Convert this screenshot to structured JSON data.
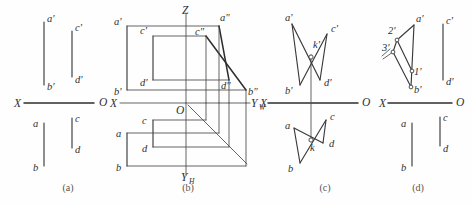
{
  "figure": {
    "background_color": "#fefefe",
    "line_color": "#3a3a3a",
    "width": 472,
    "height": 205
  },
  "panels": [
    {
      "id": "a",
      "caption": "(a)",
      "caption_x": 68,
      "caption_y": 191,
      "axis": {
        "x_label": "X",
        "o_label": "O",
        "x_label_pos": [
          14,
          107
        ],
        "o_label_pos": [
          99,
          106
        ],
        "line": [
          24,
          103,
          94,
          103
        ]
      },
      "segments": [
        {
          "name": "a'b'",
          "x1": 44,
          "y1": 22,
          "x2": 44,
          "y2": 85
        },
        {
          "name": "c'd'",
          "x1": 72,
          "y1": 31,
          "x2": 72,
          "y2": 77
        },
        {
          "name": "ab",
          "x1": 44,
          "y1": 123,
          "x2": 44,
          "y2": 166
        },
        {
          "name": "cd",
          "x1": 72,
          "y1": 118,
          "x2": 72,
          "y2": 148
        }
      ],
      "labels": [
        {
          "text": "a'",
          "x": 47,
          "y": 22
        },
        {
          "text": "c'",
          "x": 75,
          "y": 31
        },
        {
          "text": "b'",
          "x": 47,
          "y": 90
        },
        {
          "text": "d'",
          "x": 75,
          "y": 83
        },
        {
          "text": "a",
          "x": 33,
          "y": 127
        },
        {
          "text": "c",
          "x": 75,
          "y": 122
        },
        {
          "text": "b",
          "x": 33,
          "y": 171
        },
        {
          "text": "d",
          "x": 75,
          "y": 153
        }
      ]
    },
    {
      "id": "b",
      "caption": "(b)",
      "caption_x": 188,
      "caption_y": 191,
      "axis": {
        "x_label": "X",
        "o_label": "O",
        "z_label": "Z",
        "yw_label": "Y",
        "yw_sub": "W",
        "yh_label": "Y",
        "yh_sub": "H",
        "x_line": [
          120,
          103,
          244,
          103
        ],
        "z_line": [
          186,
          13,
          186,
          103
        ],
        "yh_line": [
          186,
          103,
          186,
          172
        ],
        "yw_line": [
          186,
          103,
          244,
          103
        ],
        "diagonal": [
          188,
          105,
          246,
          163
        ]
      },
      "front_view": {
        "a'": [
          127,
          26
        ],
        "b'": [
          127,
          90
        ],
        "c'": [
          153,
          36
        ],
        "d'": [
          153,
          80
        ]
      },
      "top_view": {
        "a": [
          127,
          133
        ],
        "b": [
          127,
          166
        ],
        "c": [
          153,
          120
        ],
        "d": [
          153,
          147
        ]
      },
      "side_view": {
        "a\"": [
          218,
          24
        ],
        "b\"": [
          245,
          89
        ],
        "c\"": [
          205,
          36
        ],
        "d\"": [
          228,
          80
        ]
      },
      "labels": [
        {
          "text": "a'",
          "x": 115,
          "y": 25
        },
        {
          "text": "c'",
          "x": 141,
          "y": 34
        },
        {
          "text": "b'",
          "x": 115,
          "y": 94
        },
        {
          "text": "d'",
          "x": 141,
          "y": 85
        },
        {
          "text": "Z",
          "x": 182,
          "y": 13
        },
        {
          "text": "a\"",
          "x": 219,
          "y": 21
        },
        {
          "text": "c\"",
          "x": 195,
          "y": 35
        },
        {
          "text": "d\"",
          "x": 223,
          "y": 88
        },
        {
          "text": "b\"",
          "x": 247,
          "y": 94
        },
        {
          "text": "O",
          "x": 176,
          "y": 113
        },
        {
          "text": "X",
          "x": 110,
          "y": 107
        },
        {
          "text": "a",
          "x": 116,
          "y": 137
        },
        {
          "text": "c",
          "x": 142,
          "y": 124
        },
        {
          "text": "b",
          "x": 116,
          "y": 171
        },
        {
          "text": "d",
          "x": 142,
          "y": 152
        }
      ]
    },
    {
      "id": "c",
      "caption": "(c)",
      "caption_x": 325,
      "caption_y": 191,
      "axis": {
        "x_label": "X",
        "o_label": "O",
        "line": [
          268,
          103,
          358,
          103
        ],
        "vertical": [
          311,
          57,
          311,
          140
        ]
      },
      "front_view": {
        "a'": [
          292,
          24
        ],
        "b'": [
          300,
          85
        ],
        "c'": [
          327,
          34
        ],
        "d'": [
          320,
          80
        ],
        "k'": [
          311,
          57
        ]
      },
      "top_view": {
        "a": [
          294,
          128
        ],
        "b": [
          300,
          163
        ],
        "c": [
          326,
          120
        ],
        "d": [
          323,
          143
        ],
        "k": [
          311,
          140
        ]
      },
      "labels": [
        {
          "text": "a'",
          "x": 286,
          "y": 21
        },
        {
          "text": "c'",
          "x": 331,
          "y": 32
        },
        {
          "text": "k'",
          "x": 313,
          "y": 47
        },
        {
          "text": "b'",
          "x": 288,
          "y": 93
        },
        {
          "text": "d'",
          "x": 325,
          "y": 85
        },
        {
          "text": "X",
          "x": 260,
          "y": 107
        },
        {
          "text": "O",
          "x": 362,
          "y": 106
        },
        {
          "text": "a",
          "x": 286,
          "y": 128
        },
        {
          "text": "c",
          "x": 330,
          "y": 119
        },
        {
          "text": "k",
          "x": 312,
          "y": 150
        },
        {
          "text": "b",
          "x": 288,
          "y": 171
        },
        {
          "text": "d",
          "x": 330,
          "y": 146
        }
      ]
    },
    {
      "id": "d",
      "caption": "(d)",
      "caption_x": 418,
      "caption_y": 191,
      "axis": {
        "x_label": "X",
        "o_label": "O",
        "line": [
          388,
          103,
          452,
          103
        ]
      },
      "front_view": {
        "a'": [
          414,
          25
        ],
        "b'": [
          411,
          87
        ],
        "c'": [
          443,
          24
        ],
        "d'": [
          443,
          80
        ],
        "1'": [
          412,
          71
        ],
        "2'": [
          396,
          39
        ],
        "3'": [
          392,
          51
        ]
      },
      "top_view": {
        "a": [
          412,
          123
        ],
        "b": [
          412,
          166
        ],
        "c": [
          440,
          117
        ],
        "d": [
          440,
          146
        ]
      },
      "labels": [
        {
          "text": "a'",
          "x": 417,
          "y": 22
        },
        {
          "text": "c'",
          "x": 446,
          "y": 24
        },
        {
          "text": "2'",
          "x": 389,
          "y": 34
        },
        {
          "text": "3'",
          "x": 383,
          "y": 50
        },
        {
          "text": "1'",
          "x": 415,
          "y": 74
        },
        {
          "text": "d'",
          "x": 446,
          "y": 85
        },
        {
          "text": "b'",
          "x": 414,
          "y": 92
        },
        {
          "text": "X",
          "x": 380,
          "y": 107
        },
        {
          "text": "O",
          "x": 456,
          "y": 106
        },
        {
          "text": "a",
          "x": 402,
          "y": 127
        },
        {
          "text": "c",
          "x": 443,
          "y": 121
        },
        {
          "text": "b",
          "x": 402,
          "y": 171
        },
        {
          "text": "d",
          "x": 443,
          "y": 151
        }
      ]
    }
  ]
}
